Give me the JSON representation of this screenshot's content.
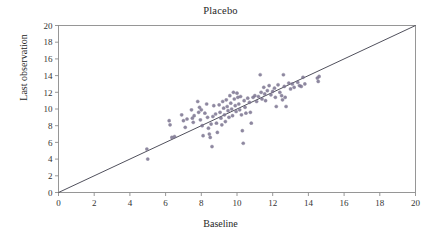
{
  "chart_data": {
    "type": "scatter",
    "title": "Placebo",
    "xlabel": "Baseline",
    "ylabel": "Last observation",
    "xlim": [
      0,
      20
    ],
    "ylim": [
      0,
      20
    ],
    "xticks": [
      0,
      2,
      4,
      6,
      8,
      10,
      12,
      14,
      16,
      18,
      20
    ],
    "yticks": [
      0,
      2,
      4,
      6,
      8,
      10,
      12,
      14,
      16,
      18,
      20
    ],
    "grid": false,
    "legend": null,
    "marker_color": "#7b7490",
    "marker_size": 1.6,
    "reference_line": {
      "name": "identity-line",
      "from": [
        0,
        0
      ],
      "to": [
        20,
        20
      ],
      "color": "#3c3c4a",
      "width": 0.9
    },
    "points": [
      [
        4.95,
        5.2
      ],
      [
        5.0,
        4.0
      ],
      [
        6.2,
        8.6
      ],
      [
        6.25,
        8.1
      ],
      [
        6.35,
        6.6
      ],
      [
        6.5,
        6.7
      ],
      [
        6.9,
        9.3
      ],
      [
        7.0,
        8.6
      ],
      [
        7.1,
        7.8
      ],
      [
        7.2,
        8.8
      ],
      [
        7.45,
        9.9
      ],
      [
        7.5,
        8.9
      ],
      [
        7.55,
        8.4
      ],
      [
        7.6,
        9.2
      ],
      [
        7.8,
        10.9
      ],
      [
        7.85,
        9.6
      ],
      [
        7.9,
        10.2
      ],
      [
        7.95,
        8.7
      ],
      [
        8.0,
        9.9
      ],
      [
        8.05,
        8.0
      ],
      [
        8.1,
        6.8
      ],
      [
        8.2,
        9.5
      ],
      [
        8.3,
        10.6
      ],
      [
        8.35,
        9.0
      ],
      [
        8.4,
        7.7
      ],
      [
        8.45,
        7.0
      ],
      [
        8.5,
        6.6
      ],
      [
        8.55,
        8.2
      ],
      [
        8.6,
        5.5
      ],
      [
        8.65,
        9.1
      ],
      [
        8.7,
        10.4
      ],
      [
        8.8,
        9.4
      ],
      [
        8.85,
        8.3
      ],
      [
        8.9,
        7.2
      ],
      [
        9.0,
        10.5
      ],
      [
        9.05,
        9.6
      ],
      [
        9.1,
        8.9
      ],
      [
        9.15,
        8.1
      ],
      [
        9.2,
        10.9
      ],
      [
        9.25,
        10.1
      ],
      [
        9.3,
        9.3
      ],
      [
        9.35,
        8.5
      ],
      [
        9.4,
        11.1
      ],
      [
        9.45,
        10.3
      ],
      [
        9.5,
        9.8
      ],
      [
        9.55,
        9.0
      ],
      [
        9.6,
        11.6
      ],
      [
        9.65,
        10.7
      ],
      [
        9.7,
        10.0
      ],
      [
        9.75,
        9.2
      ],
      [
        9.8,
        12.0
      ],
      [
        9.85,
        11.2
      ],
      [
        9.9,
        10.4
      ],
      [
        9.95,
        9.7
      ],
      [
        10.0,
        11.9
      ],
      [
        10.05,
        11.4
      ],
      [
        10.1,
        10.6
      ],
      [
        10.15,
        9.9
      ],
      [
        10.2,
        11.5
      ],
      [
        10.25,
        9.3
      ],
      [
        10.3,
        7.4
      ],
      [
        10.35,
        5.9
      ],
      [
        10.4,
        11.0
      ],
      [
        10.45,
        10.2
      ],
      [
        10.5,
        9.5
      ],
      [
        10.6,
        11.3
      ],
      [
        10.7,
        10.8
      ],
      [
        10.75,
        9.6
      ],
      [
        10.8,
        8.3
      ],
      [
        10.9,
        11.4
      ],
      [
        11.0,
        11.6
      ],
      [
        11.1,
        10.9
      ],
      [
        11.2,
        11.5
      ],
      [
        11.3,
        14.1
      ],
      [
        11.35,
        12.0
      ],
      [
        11.4,
        11.2
      ],
      [
        11.5,
        12.6
      ],
      [
        11.55,
        11.8
      ],
      [
        11.6,
        11.0
      ],
      [
        11.7,
        12.2
      ],
      [
        11.8,
        12.8
      ],
      [
        11.9,
        11.7
      ],
      [
        12.0,
        12.1
      ],
      [
        12.1,
        12.5
      ],
      [
        12.15,
        11.4
      ],
      [
        12.2,
        10.3
      ],
      [
        12.3,
        12.9
      ],
      [
        12.4,
        12.0
      ],
      [
        12.5,
        11.6
      ],
      [
        12.55,
        11.1
      ],
      [
        12.6,
        14.1
      ],
      [
        12.65,
        12.7
      ],
      [
        12.7,
        11.4
      ],
      [
        12.75,
        10.3
      ],
      [
        12.9,
        13.1
      ],
      [
        13.0,
        12.4
      ],
      [
        13.1,
        13.0
      ],
      [
        13.2,
        12.6
      ],
      [
        13.4,
        13.2
      ],
      [
        13.5,
        12.8
      ],
      [
        13.6,
        12.7
      ],
      [
        13.7,
        13.8
      ],
      [
        13.8,
        13.0
      ],
      [
        14.5,
        13.7
      ],
      [
        14.55,
        13.3
      ],
      [
        14.6,
        13.9
      ]
    ]
  }
}
